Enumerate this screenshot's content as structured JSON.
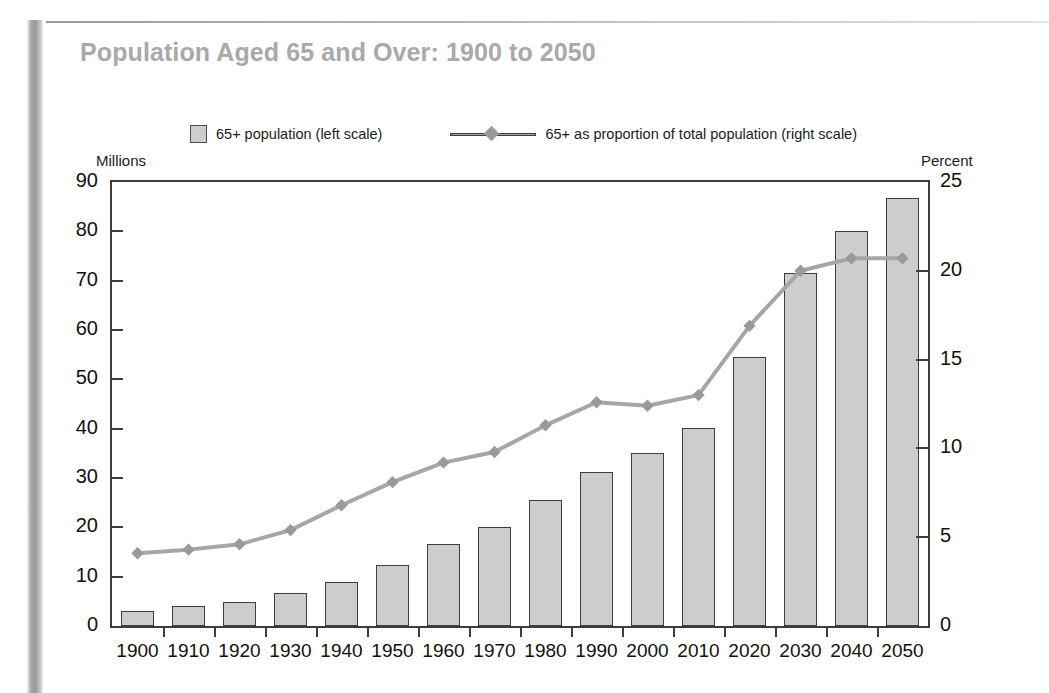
{
  "title": "Population Aged 65 and Over: 1900 to 2050",
  "legend": {
    "bar_label": "65+ population (left scale)",
    "line_label": "65+ as proportion of total population (right scale)",
    "bar_swatch_color": "#cdcdcd",
    "line_color": "#a6a6a6"
  },
  "axes": {
    "left_caption": "Millions",
    "right_caption": "Percent",
    "left_ticks": [
      "90",
      "80",
      "70",
      "60",
      "50",
      "40",
      "30",
      "20",
      "10",
      "0"
    ],
    "right_ticks": [
      "25",
      "20",
      "15",
      "10",
      "5",
      "0"
    ]
  },
  "chart_data": {
    "type": "bar",
    "title": "Population Aged 65 and Over: 1900 to 2050",
    "xlabel": "",
    "ylabel": "Millions",
    "y2label": "Percent",
    "ylim": [
      0,
      90
    ],
    "y2lim": [
      0,
      25
    ],
    "grid": false,
    "legend_position": "top",
    "categories": [
      "1900",
      "1910",
      "1920",
      "1930",
      "1940",
      "1950",
      "1960",
      "1970",
      "1980",
      "1990",
      "2000",
      "2010",
      "2020",
      "2030",
      "2040",
      "2050"
    ],
    "series": [
      {
        "name": "65+ population (left scale)",
        "type": "bar",
        "axis": "left",
        "unit": "millions",
        "values": [
          3.1,
          4.0,
          4.9,
          6.6,
          9.0,
          12.3,
          16.6,
          20.1,
          25.5,
          31.2,
          35.0,
          40.2,
          54.6,
          71.5,
          80.0,
          86.7
        ]
      },
      {
        "name": "65+ as proportion of total population (right scale)",
        "type": "line",
        "axis": "right",
        "unit": "percent",
        "values": [
          4.1,
          4.3,
          4.6,
          5.4,
          6.8,
          8.1,
          9.2,
          9.8,
          11.3,
          12.6,
          12.4,
          13.0,
          16.9,
          20.0,
          20.7,
          20.7
        ]
      }
    ]
  },
  "xlabels": [
    "1900",
    "1910",
    "1920",
    "1930",
    "1940",
    "1950",
    "1960",
    "1970",
    "1980",
    "1990",
    "2000",
    "2010",
    "2020",
    "2030",
    "2040",
    "2050"
  ]
}
